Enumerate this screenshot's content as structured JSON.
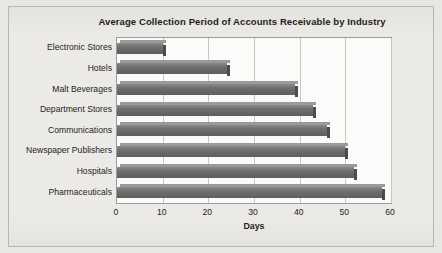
{
  "chart_data": {
    "type": "bar",
    "orientation": "horizontal",
    "title": "Average Collection Period of Accounts Receivable by Industry",
    "xlabel": "Days",
    "ylabel": "",
    "xlim": [
      0,
      60
    ],
    "xticks": [
      0,
      10,
      20,
      30,
      40,
      50,
      60
    ],
    "grid": true,
    "legend": false,
    "categories": [
      "Electronic Stores",
      "Hotels",
      "Malt Beverages",
      "Department Stores",
      "Communications",
      "Newspaper Publishers",
      "Hospitals",
      "Pharmaceuticals"
    ],
    "values": [
      10,
      24,
      39,
      43,
      46,
      50,
      52,
      58
    ],
    "bar_color": "#6f6f6f",
    "plot_background": "#fbfbfa",
    "figure_background": "#eceae6"
  }
}
